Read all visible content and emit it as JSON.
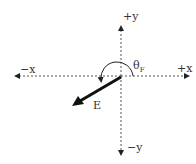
{
  "diagram": {
    "axes": {
      "pos_x_label": "+x",
      "neg_x_label": "−x",
      "pos_y_label": "+y",
      "neg_y_label": "−y"
    },
    "vector": {
      "label": "E",
      "direction": "down-left (third quadrant)"
    },
    "angle": {
      "symbol": "θ",
      "subscript": "F",
      "description": "angle measured counterclockwise from +x axis to vector E"
    },
    "colors": {
      "axis": "#555555",
      "vector": "#111111",
      "text": "#333333",
      "background": "#ffffff"
    }
  }
}
